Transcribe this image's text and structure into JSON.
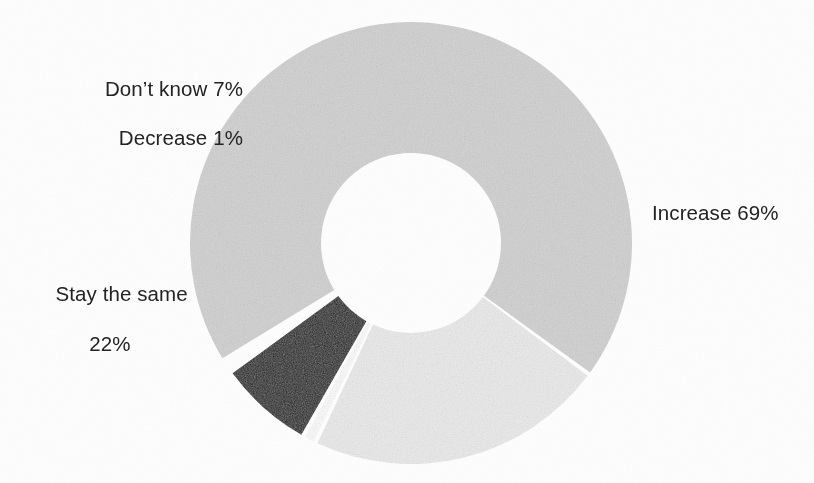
{
  "chart_data": {
    "type": "pie",
    "variant": "donut",
    "title": "",
    "subtitle": "",
    "xlabel": "",
    "ylabel": "",
    "legend_position": "none",
    "grid": false,
    "units": "percent",
    "value_suffix": "%",
    "total": 99,
    "start_angle_deg": -122,
    "direction": "clockwise",
    "categories": [
      "Increase",
      "Stay the same",
      "Decrease",
      "Don't know"
    ],
    "values": [
      69,
      22,
      1,
      7
    ],
    "colors": [
      "#d2d2d2",
      "#ececec",
      "#fdfdfd",
      "#1a1a1a"
    ],
    "slices": [
      {
        "label": "Increase",
        "value": 69,
        "display": "Increase 69%",
        "color": "#d2d2d2",
        "start_deg": -122,
        "sweep_deg": 248.4
      },
      {
        "label": "Stay the same",
        "value": 22,
        "display": "Stay the same 22%",
        "color": "#ececec",
        "start_deg": 126.4,
        "sweep_deg": 79.2
      },
      {
        "label": "Decrease",
        "value": 1,
        "display": "Decrease 1%",
        "color": "#fdfdfd",
        "start_deg": 205.6,
        "sweep_deg": 3.6
      },
      {
        "label": "Don't know",
        "value": 7,
        "display": "Don't know 7%",
        "color": "#1a1a1a",
        "start_deg": 209.2,
        "sweep_deg": 25.2
      }
    ],
    "geometry": {
      "center_x": 411,
      "center_y": 243,
      "outer_radius": 221,
      "inner_radius": 90,
      "gap_deg": 1.1
    }
  },
  "labels": {
    "increase": "Increase 69%",
    "stay_the_same_line1": "Stay the same",
    "stay_the_same_line2": "22%",
    "decrease": "Decrease 1%",
    "dont_know": "Don’t know 7%"
  },
  "style": {
    "background": "#fefefe",
    "text_color": "#232323",
    "increase_color": "#d2d2d2",
    "stay_color": "#ececec",
    "decrease_color": "#fdfdfd",
    "dontknow_color": "#1a1a1a"
  }
}
